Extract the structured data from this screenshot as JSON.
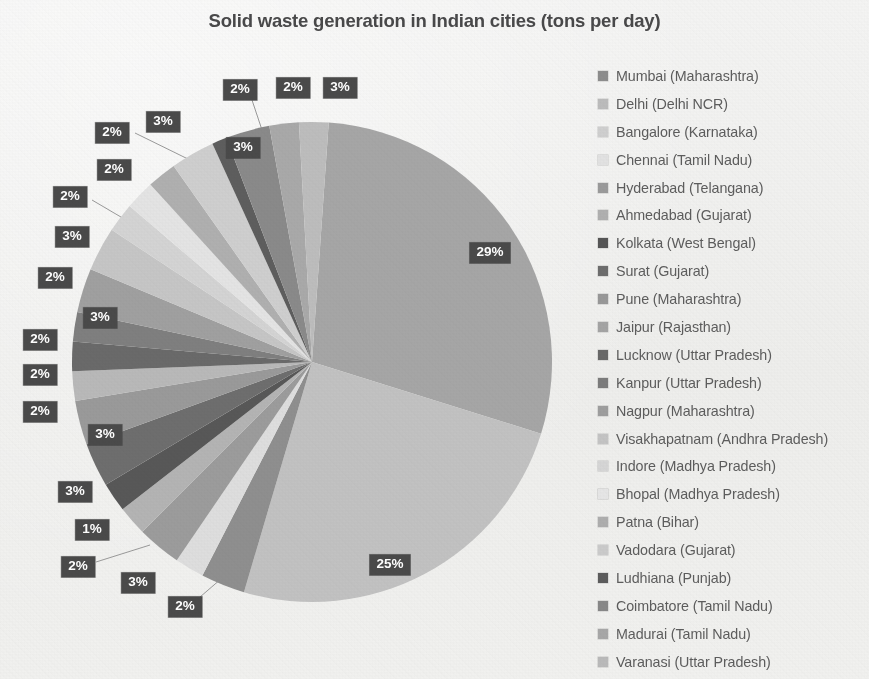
{
  "chart_data": {
    "type": "pie",
    "title": "Solid waste generation in Indian cities (tons per day)",
    "xlabel": "",
    "ylabel": "",
    "legend_position": "right",
    "grid": false,
    "categories": [
      "Mumbai (Maharashtra)",
      "Delhi (Delhi NCR)",
      "Bangalore (Karnataka)",
      "Chennai (Tamil Nadu)",
      "Hyderabad (Telangana)",
      "Ahmedabad (Gujarat)",
      "Kolkata (West Bengal)",
      "Surat (Gujarat)",
      "Pune (Maharashtra)",
      "Jaipur (Rajasthan)",
      "Lucknow (Uttar Pradesh)",
      "Kanpur (Uttar Pradesh)",
      "Nagpur (Maharashtra)",
      "Visakhapatnam (Andhra Pradesh)",
      "Indore (Madhya Pradesh)",
      "Bhopal (Madhya Pradesh)",
      "Patna (Bihar)",
      "Vadodara (Gujarat)",
      "Ludhiana (Punjab)",
      "Coimbatore (Tamil Nadu)",
      "Madurai (Tamil Nadu)",
      "Varanasi (Uttar Pradesh)"
    ],
    "values": [
      29,
      25,
      3,
      2,
      3,
      2,
      2,
      3,
      3,
      2,
      2,
      2,
      3,
      3,
      2,
      2,
      2,
      3,
      1,
      3,
      2,
      2
    ],
    "labels": [
      "29%",
      "25%",
      "3%",
      "2%",
      "3%",
      "2%",
      "2%",
      "3%",
      "3%",
      "2%",
      "2%",
      "2%",
      "3%",
      "3%",
      "2%",
      "2%",
      "2%",
      "3%",
      "1%",
      "3%",
      "2%",
      "2%"
    ],
    "slice_colors": [
      "#a6a6a6",
      "#c2c2c2",
      "#8f8f8f",
      "#dedede",
      "#9c9c9c",
      "#b4b4b4",
      "#585858",
      "#6e6e6e",
      "#9a9a9a",
      "#b9b9b9",
      "#6a6a6a",
      "#7f7f7f",
      "#a0a0a0",
      "#c6c6c6",
      "#d4d4d4",
      "#e4e4e4",
      "#b0b0b0",
      "#cfcfcf",
      "#5e5e5e",
      "#8a8a8a",
      "#a9a9a9",
      "#bdbdbd"
    ]
  },
  "legend": {
    "items": [
      {
        "label": "Mumbai (Maharashtra)",
        "color": "#8d8d8d"
      },
      {
        "label": "Delhi (Delhi NCR)",
        "color": "#bcbcbc"
      },
      {
        "label": "Bangalore (Karnataka)",
        "color": "#cfcfcf"
      },
      {
        "label": "Chennai (Tamil Nadu)",
        "color": "#e2e2e2"
      },
      {
        "label": "Hyderabad (Telangana)",
        "color": "#9a9a9a"
      },
      {
        "label": "Ahmedabad (Gujarat)",
        "color": "#b0b0b0"
      },
      {
        "label": "Kolkata (West Bengal)",
        "color": "#555555"
      },
      {
        "label": "Surat (Gujarat)",
        "color": "#6d6d6d"
      },
      {
        "label": "Pune (Maharashtra)",
        "color": "#989898"
      },
      {
        "label": "Jaipur (Rajasthan)",
        "color": "#a4a4a4"
      },
      {
        "label": "Lucknow (Uttar Pradesh)",
        "color": "#686868"
      },
      {
        "label": "Kanpur (Uttar Pradesh)",
        "color": "#7c7c7c"
      },
      {
        "label": "Nagpur (Maharashtra)",
        "color": "#9e9e9e"
      },
      {
        "label": "Visakhapatnam (Andhra Pradesh)",
        "color": "#c4c4c4"
      },
      {
        "label": "Indore (Madhya Pradesh)",
        "color": "#d6d6d6"
      },
      {
        "label": "Bhopal (Madhya Pradesh)",
        "color": "#e6e6e6"
      },
      {
        "label": "Patna (Bihar)",
        "color": "#aeaeae"
      },
      {
        "label": "Vadodara (Gujarat)",
        "color": "#cbcbcb"
      },
      {
        "label": "Ludhiana (Punjab)",
        "color": "#5c5c5c"
      },
      {
        "label": "Coimbatore (Tamil Nadu)",
        "color": "#888888"
      },
      {
        "label": "Madurai (Tamil Nadu)",
        "color": "#a7a7a7"
      },
      {
        "label": "Varanasi (Uttar Pradesh)",
        "color": "#bababa"
      }
    ]
  },
  "pie_geometry": {
    "cx": 312,
    "cy": 362,
    "r": 240,
    "start_angle_deg": -86
  },
  "data_labels": [
    {
      "text": "29%",
      "x": 490,
      "y": 253,
      "leader": null
    },
    {
      "text": "25%",
      "x": 390,
      "y": 565,
      "leader": null
    },
    {
      "text": "2%",
      "x": 185,
      "y": 607,
      "leader": [
        200,
        597,
        243,
        560
      ]
    },
    {
      "text": "3%",
      "x": 138,
      "y": 583,
      "leader": null
    },
    {
      "text": "2%",
      "x": 78,
      "y": 567,
      "leader": [
        96,
        562,
        150,
        545
      ]
    },
    {
      "text": "1%",
      "x": 92,
      "y": 530,
      "leader": null
    },
    {
      "text": "3%",
      "x": 75,
      "y": 492,
      "leader": null
    },
    {
      "text": "3%",
      "x": 105,
      "y": 435,
      "leader": null
    },
    {
      "text": "2%",
      "x": 40,
      "y": 412,
      "leader": null
    },
    {
      "text": "2%",
      "x": 40,
      "y": 375,
      "leader": null
    },
    {
      "text": "2%",
      "x": 40,
      "y": 340,
      "leader": null
    },
    {
      "text": "3%",
      "x": 100,
      "y": 318,
      "leader": null
    },
    {
      "text": "2%",
      "x": 55,
      "y": 278,
      "leader": null
    },
    {
      "text": "3%",
      "x": 72,
      "y": 237,
      "leader": null
    },
    {
      "text": "2%",
      "x": 70,
      "y": 197,
      "leader": [
        92,
        200,
        160,
        240
      ]
    },
    {
      "text": "2%",
      "x": 114,
      "y": 170,
      "leader": null
    },
    {
      "text": "2%",
      "x": 112,
      "y": 133,
      "leader": [
        135,
        133,
        190,
        160
      ]
    },
    {
      "text": "3%",
      "x": 163,
      "y": 122,
      "leader": null
    },
    {
      "text": "3%",
      "x": 243,
      "y": 148,
      "leader": null
    },
    {
      "text": "2%",
      "x": 240,
      "y": 90,
      "leader": [
        252,
        100,
        268,
        148
      ]
    },
    {
      "text": "2%",
      "x": 293,
      "y": 88,
      "leader": null
    },
    {
      "text": "3%",
      "x": 340,
      "y": 88,
      "leader": null
    }
  ]
}
